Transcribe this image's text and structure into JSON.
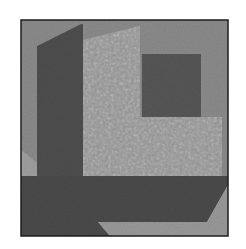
{
  "image": {
    "width": 246,
    "height": 249,
    "background": "#ffffff",
    "frame": {
      "x": 21,
      "y": 20,
      "w": 207,
      "h": 216,
      "stroke": "#1e1e1e",
      "fill": "#8e8e8e"
    }
  },
  "colors": {
    "mid_gray": "#8e8e8e",
    "dark_gray": "#4e4e4e",
    "speckled_light": "#9c9c9c",
    "inner_square": "#555555",
    "edge_light": "#a2a2a2"
  },
  "regions": [
    {
      "name": "background-gray-region",
      "fill": "#8c8c8c",
      "points": "21,20 228,20 228,236 21,236"
    },
    {
      "name": "speckled-light-region",
      "fill": "#9d9d9d",
      "points": "83,40 140,26 140,117 222,117 222,176 83,176"
    },
    {
      "name": "dark-pillar-region",
      "fill": "#4f4f4f",
      "points": "37,46 81,24 83,24 83,176 37,176"
    },
    {
      "name": "left-light-wedge",
      "fill": "#a0a0a0",
      "points": "21,150 37,163 37,176 21,176"
    },
    {
      "name": "dark-bottom-band",
      "fill": "#4b4b4b",
      "points": "21,176 228,176 228,185 207,222 98,222 110,236 21,236"
    },
    {
      "name": "bottom-light-wedge",
      "fill": "#9a9a9a",
      "points": "98,222 207,222 228,185 228,236 110,236"
    },
    {
      "name": "inner-dark-square",
      "fill": "#575757",
      "points": "142,54 201,54 201,117 142,117"
    }
  ]
}
